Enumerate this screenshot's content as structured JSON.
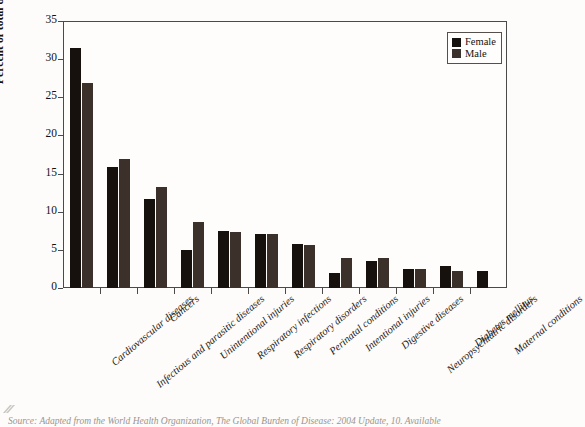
{
  "chart_data": {
    "type": "bar",
    "title": "",
    "xlabel": "",
    "ylabel": "Percent of total deaths",
    "ylim": [
      0,
      35
    ],
    "yticks": [
      0,
      5,
      10,
      15,
      20,
      25,
      30,
      35
    ],
    "grid": false,
    "legend_position": "top-right",
    "categories": [
      "Cardiovascular diseases",
      "Infectious and parasitic diseases",
      "Cancers",
      "Unintentional injuries",
      "Respiratory infections",
      "Respiratory disorders",
      "Perinatal conditions",
      "Intentional injuries",
      "Digestive diseases",
      "Neuropsychiatric disorders",
      "Diabetes mellitus",
      "Maternal conditions"
    ],
    "series": [
      {
        "name": "Female",
        "color": "#17110d",
        "values": [
          31.5,
          15.8,
          11.7,
          5.0,
          7.5,
          7.1,
          5.8,
          2.0,
          3.5,
          2.5,
          2.9,
          2.2
        ]
      },
      {
        "name": "Male",
        "color": "#3c302a",
        "values": [
          26.9,
          16.9,
          13.3,
          8.7,
          7.3,
          7.1,
          5.6,
          3.9,
          3.9,
          2.5,
          2.2,
          null
        ]
      }
    ]
  },
  "legend": {
    "items": [
      {
        "label": "Female",
        "key": "female"
      },
      {
        "label": "Male",
        "key": "male"
      }
    ]
  },
  "axis": {
    "y_title": "Percent of total deaths",
    "y_tick_labels": [
      "0",
      "5",
      "10",
      "15",
      "20",
      "25",
      "30",
      "35"
    ]
  },
  "caption": {
    "text": "Source: Adapted from the World Health Organization, The Global Burden of Disease: 2004 Update, 10. Available"
  }
}
